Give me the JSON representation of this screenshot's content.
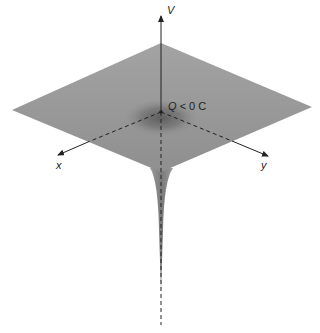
{
  "axes": {
    "vertical": "V",
    "x": "x",
    "y": "y"
  },
  "annotation": {
    "charge_symbol": "Q",
    "relation": "< 0 C"
  },
  "colors": {
    "plane": "#9a9a9a",
    "plane_edge": "#8c8c8c",
    "well": "#6e6e6e",
    "funnel": "#8a8a8a",
    "axis": "#222222",
    "background": "#ffffff"
  }
}
